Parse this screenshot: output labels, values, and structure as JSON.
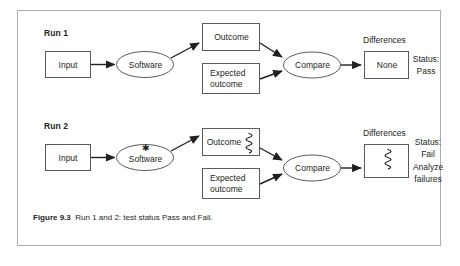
{
  "figure": {
    "caption_label": "Figure 9.3",
    "caption_text": "Run 1 and 2: test status Pass and Fail.",
    "frame_color": "#aeaeae",
    "ink_color": "#231f20",
    "background": "#ffffff"
  },
  "runs": [
    {
      "id": "run-1",
      "label": "Run 1",
      "input_label": "Input",
      "software_label": "Software",
      "software_defect_marker": "",
      "outcome_label": "Outcome",
      "outcome_defect_marker": "",
      "expected_label": "Expected\noutcome",
      "compare_label": "Compare",
      "differences_heading": "Differences",
      "differences_value": "None",
      "differences_defect_marker": "",
      "status": "Status:\nPass"
    },
    {
      "id": "run-2",
      "label": "Run 2",
      "input_label": "Input",
      "software_label": "Software",
      "software_defect_marker": "★",
      "outcome_label": "Outcome",
      "outcome_defect_marker": "squiggle",
      "expected_label": "Expected\noutcome",
      "compare_label": "Compare",
      "differences_heading": "Differences",
      "differences_value": "",
      "differences_defect_marker": "squiggle",
      "status": "Status:\nFail\nAnalyze\nfailures"
    }
  ]
}
